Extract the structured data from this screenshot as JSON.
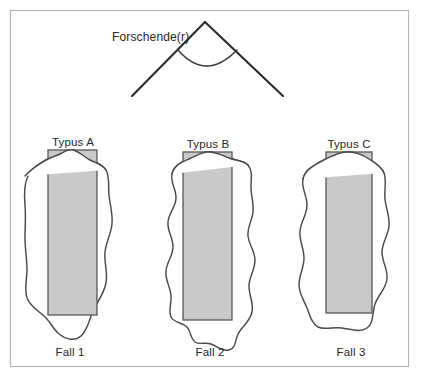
{
  "figure": {
    "title_label": "Forschende(r)",
    "background_color": "#ffffff",
    "frame_color": "#b3b3b3",
    "outline_color": "#4a4a4a",
    "rect_fill_color": "#c9c9c9",
    "rect_stroke_color": "#575757",
    "cone_color": "#2b2b2b"
  },
  "cases": [
    {
      "typus_label": "Typus A",
      "fall_label": "Fall 1"
    },
    {
      "typus_label": "Typus B",
      "fall_label": "Fall 2"
    },
    {
      "typus_label": "Typus C",
      "fall_label": "Fall 3"
    }
  ]
}
